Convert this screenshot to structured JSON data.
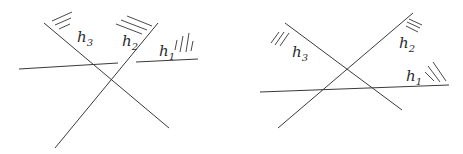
{
  "diagrams": [
    {
      "name": "left",
      "labels": [
        {
          "id": "h3",
          "base": "h",
          "sub": "3",
          "x": 77,
          "y": 42
        },
        {
          "id": "h2",
          "base": "h",
          "sub": "2",
          "x": 122,
          "y": 46
        },
        {
          "id": "h1",
          "base": "h",
          "sub": "1",
          "x": 159,
          "y": 56
        }
      ]
    },
    {
      "name": "right",
      "labels": [
        {
          "id": "h3",
          "base": "h",
          "sub": "3",
          "x": 292,
          "y": 57
        },
        {
          "id": "h2",
          "base": "h",
          "sub": "2",
          "x": 399,
          "y": 48
        },
        {
          "id": "h1",
          "base": "h",
          "sub": "1",
          "x": 406,
          "y": 81
        }
      ]
    }
  ]
}
